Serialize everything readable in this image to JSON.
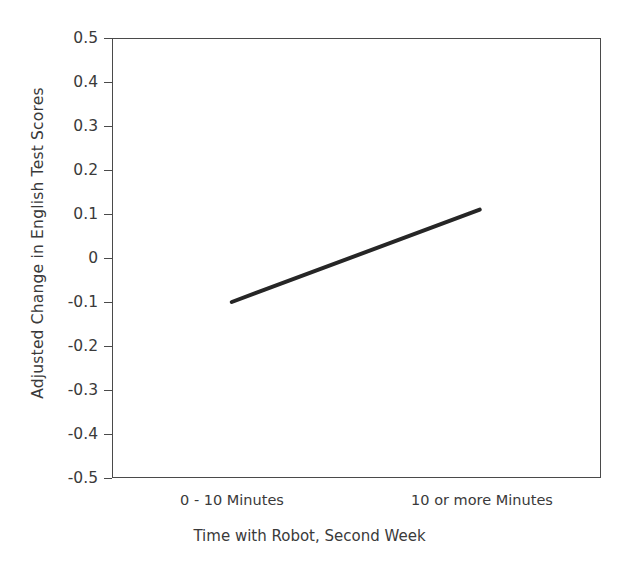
{
  "chart_data": {
    "type": "line",
    "title": "",
    "xlabel": "Time with Robot, Second Week",
    "ylabel": "Adjusted Change in English Test Scores",
    "categories": [
      "0 - 10 Minutes",
      "10 or more Minutes"
    ],
    "values": [
      -0.1,
      0.11
    ],
    "series": [
      {
        "name": "Adjusted Change in English Test Scores",
        "values": [
          -0.1,
          0.11
        ],
        "color": "#262626",
        "line_width": 4,
        "markers": false
      }
    ],
    "ylim": [
      -0.5,
      0.5
    ],
    "ytick_step": 0.1,
    "ytick_labels": [
      "0.5",
      "0.4",
      "0.3",
      "0.2",
      "0.1",
      "0",
      "-0.1",
      "-0.2",
      "-0.3",
      "-0.4",
      "-0.5"
    ],
    "ytick_values": [
      0.5,
      0.4,
      0.3,
      0.2,
      0.1,
      0,
      -0.1,
      -0.2,
      -0.3,
      -0.4,
      -0.5
    ],
    "xtick_labels": [
      "0 - 10 Minutes",
      "10 or more Minutes"
    ],
    "grid": false,
    "legend": false,
    "legend_position": "none",
    "frame": true,
    "background_color": "#ffffff",
    "axis_color": "#4a4a4a",
    "text_color": "#3a3a3a"
  }
}
